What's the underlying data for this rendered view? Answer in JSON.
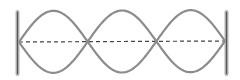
{
  "diagram": {
    "type": "standing-wave",
    "loops": 3,
    "nodes": 4,
    "antinodes": 3,
    "fixed_ends": [
      "left",
      "right"
    ],
    "geometry": {
      "left_x": 19,
      "right_x": 225,
      "center_y_left": 42,
      "center_y_right": 41,
      "amplitude": 31,
      "wall_top": 10,
      "wall_bottom": 76
    },
    "colors": {
      "wave": "#8c8c8c",
      "wall": "#9a9a9a",
      "wall_core": "#555555",
      "axis": "#444444",
      "background": "#ffffff"
    }
  }
}
